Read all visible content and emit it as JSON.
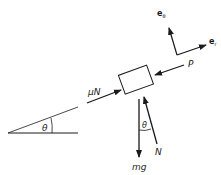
{
  "diagram": {
    "type": "free-body diagram",
    "incline": {
      "angle_label": "θ"
    },
    "block": {
      "description": "block on incline"
    },
    "forces": [
      {
        "label": "μN",
        "direction": "up-slope friction"
      },
      {
        "label": "P",
        "direction": "pushing down-slope"
      },
      {
        "label": "mg",
        "direction": "vertical down"
      },
      {
        "label": "N",
        "direction": "normal to incline"
      }
    ],
    "normal_angle_label": "θ",
    "basis": {
      "e_theta": "e",
      "e_theta_sub": "θ",
      "e_r": "e",
      "e_r_sub": "r"
    }
  },
  "colors": {
    "ink": "#1a1a1a",
    "background": "#ffffff"
  }
}
